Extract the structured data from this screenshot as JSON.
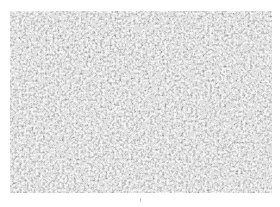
{
  "image": {
    "description": "grayscale granular micrograph texture",
    "colors": {
      "background": "#ffffff",
      "grain_light": "#f2f2f2",
      "grain_dark": "#2e2e2e"
    }
  }
}
